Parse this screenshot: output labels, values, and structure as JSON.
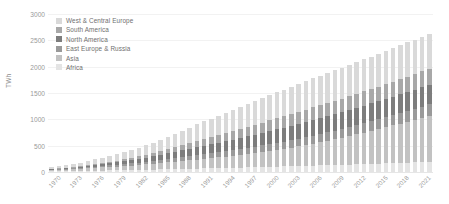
{
  "chart_data": {
    "type": "bar",
    "stacked": true,
    "title": "",
    "xlabel": "",
    "ylabel": "TWh",
    "ylim": [
      0,
      3000
    ],
    "yticks": [
      0,
      500,
      1000,
      1500,
      2000,
      2500,
      3000
    ],
    "ytick_labels": [
      "0",
      "500",
      "1000",
      "1500",
      "2000",
      "2500",
      "3000"
    ],
    "grid": true,
    "legend_position": "top-left",
    "x": [
      1970,
      1971,
      1972,
      1973,
      1974,
      1975,
      1976,
      1977,
      1978,
      1979,
      1980,
      1981,
      1982,
      1983,
      1984,
      1985,
      1986,
      1987,
      1988,
      1989,
      1990,
      1991,
      1992,
      1993,
      1994,
      1995,
      1996,
      1997,
      1998,
      1999,
      2000,
      2001,
      2002,
      2003,
      2004,
      2005,
      2006,
      2007,
      2008,
      2009,
      2010,
      2011,
      2012,
      2013,
      2014,
      2015,
      2016,
      2017,
      2018,
      2019,
      2020,
      2021,
      2022
    ],
    "xtick_labels": [
      "1970",
      "1973",
      "1976",
      "1979",
      "1982",
      "1985",
      "1988",
      "1991",
      "1994",
      "1997",
      "2000",
      "2003",
      "2006",
      "2009",
      "2012",
      "2015",
      "2018",
      "2021"
    ],
    "colors": {
      "West & Central Europe": "#d9d9d9",
      "South America": "#a8a8a8",
      "North America": "#7d7d7d",
      "East Europe & Russia": "#9a9a9a",
      "Asia": "#c2c2c2",
      "Africa": "#e4e4e4"
    },
    "stack_order_bottom_to_top": [
      "Africa",
      "Asia",
      "East Europe & Russia",
      "North America",
      "South America",
      "West & Central Europe"
    ],
    "series": [
      {
        "name": "Africa",
        "values": [
          12,
          14,
          16,
          18,
          20,
          22,
          25,
          28,
          30,
          33,
          36,
          38,
          41,
          44,
          47,
          50,
          54,
          57,
          60,
          63,
          66,
          68,
          71,
          74,
          77,
          80,
          84,
          87,
          90,
          94,
          98,
          102,
          105,
          109,
          113,
          117,
          121,
          125,
          129,
          133,
          138,
          142,
          147,
          151,
          156,
          160,
          165,
          170,
          175,
          180,
          184,
          188,
          192
        ]
      },
      {
        "name": "Asia",
        "values": [
          22,
          26,
          30,
          35,
          40,
          46,
          52,
          58,
          64,
          70,
          78,
          85,
          92,
          100,
          108,
          118,
          128,
          138,
          148,
          158,
          170,
          180,
          192,
          204,
          216,
          230,
          244,
          258,
          272,
          288,
          304,
          320,
          338,
          356,
          376,
          396,
          418,
          440,
          464,
          488,
          514,
          540,
          568,
          596,
          624,
          654,
          684,
          714,
          746,
          778,
          810,
          844,
          878
        ]
      },
      {
        "name": "East Europe & Russia",
        "values": [
          10,
          12,
          14,
          16,
          19,
          22,
          25,
          28,
          32,
          36,
          40,
          44,
          48,
          52,
          57,
          62,
          67,
          72,
          77,
          82,
          88,
          92,
          96,
          100,
          104,
          108,
          112,
          116,
          120,
          124,
          128,
          132,
          136,
          140,
          144,
          148,
          152,
          156,
          160,
          164,
          168,
          172,
          176,
          180,
          184,
          188,
          192,
          196,
          200,
          204,
          208,
          212,
          216
        ]
      },
      {
        "name": "North America",
        "values": [
          8,
          10,
          13,
          16,
          20,
          24,
          29,
          34,
          40,
          46,
          53,
          60,
          68,
          76,
          85,
          94,
          104,
          114,
          125,
          136,
          148,
          158,
          168,
          178,
          188,
          198,
          208,
          218,
          228,
          238,
          248,
          256,
          264,
          272,
          280,
          288,
          296,
          302,
          308,
          314,
          320,
          326,
          332,
          336,
          340,
          344,
          348,
          352,
          356,
          360,
          364,
          368,
          372
        ]
      },
      {
        "name": "South America",
        "values": [
          5,
          6,
          8,
          10,
          13,
          16,
          20,
          24,
          29,
          34,
          40,
          46,
          53,
          60,
          68,
          76,
          85,
          94,
          104,
          114,
          124,
          132,
          140,
          148,
          156,
          164,
          172,
          180,
          188,
          196,
          204,
          210,
          216,
          222,
          228,
          234,
          240,
          244,
          248,
          252,
          256,
          260,
          264,
          268,
          272,
          276,
          280,
          284,
          288,
          292,
          296,
          300,
          304
        ]
      },
      {
        "name": "West & Central Europe",
        "values": [
          40,
          46,
          52,
          60,
          68,
          78,
          88,
          98,
          110,
          122,
          134,
          148,
          162,
          178,
          194,
          212,
          230,
          250,
          270,
          290,
          312,
          330,
          348,
          366,
          384,
          402,
          420,
          436,
          452,
          468,
          484,
          496,
          508,
          520,
          532,
          544,
          556,
          564,
          572,
          580,
          588,
          596,
          604,
          610,
          616,
          622,
          628,
          634,
          640,
          646,
          652,
          658,
          664
        ]
      }
    ],
    "totals": [
      97,
      114,
      133,
      155,
      180,
      208,
      239,
      270,
      305,
      341,
      381,
      421,
      464,
      510,
      559,
      612,
      668,
      725,
      784,
      843,
      908,
      960,
      1015,
      1070,
      1125,
      1182,
      1240,
      1295,
      1350,
      1408,
      1466,
      1516,
      1567,
      1619,
      1673,
      1727,
      1783,
      1831,
      1881,
      1931,
      1984,
      2036,
      2091,
      2141,
      2192,
      2244,
      2297,
      2350,
      2405,
      2460,
      2514,
      2570,
      2626
    ]
  },
  "legend": {
    "items": [
      {
        "label": "West & Central Europe"
      },
      {
        "label": "South America"
      },
      {
        "label": "North America"
      },
      {
        "label": "East Europe & Russia"
      },
      {
        "label": "Asia"
      },
      {
        "label": "Africa"
      }
    ]
  }
}
